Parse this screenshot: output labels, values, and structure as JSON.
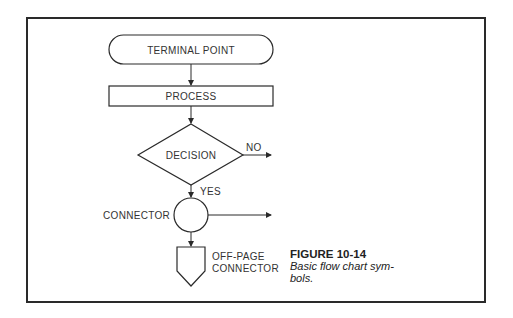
{
  "figure": {
    "number": "FIGURE 10-14",
    "caption": "Basic flow chart sym-bols.",
    "caption_line1": "Basic flow chart sym-",
    "caption_line2": "bols."
  },
  "symbols": {
    "terminal": {
      "label": "TERMINAL POINT"
    },
    "process": {
      "label": "PROCESS"
    },
    "decision": {
      "label": "DECISION",
      "no_label": "NO",
      "yes_label": "YES"
    },
    "connector": {
      "label": "CONNECTOR"
    },
    "offpage": {
      "label_line1": "OFF-PAGE",
      "label_line2": "CONNECTOR"
    }
  },
  "colors": {
    "stroke": "#2a2a2a",
    "text": "#333333",
    "background": "#ffffff"
  }
}
